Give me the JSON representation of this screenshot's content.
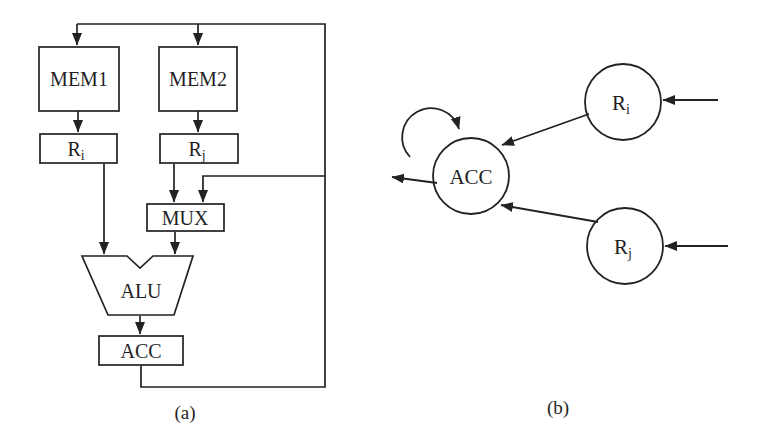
{
  "figure": {
    "background": "#ffffff",
    "ink": "#222222",
    "panel_a": {
      "caption": "(a)",
      "blocks": {
        "mem1": "MEM1",
        "mem2": "MEM2",
        "ri_base": "R",
        "ri_sub": "i",
        "rj_base": "R",
        "rj_sub": "j",
        "mux": "MUX",
        "alu": "ALU",
        "acc": "ACC"
      }
    },
    "panel_b": {
      "caption": "(b)",
      "nodes": {
        "acc": "ACC",
        "ri_base": "R",
        "ri_sub": "i",
        "rj_base": "R",
        "rj_sub": "j"
      }
    }
  }
}
